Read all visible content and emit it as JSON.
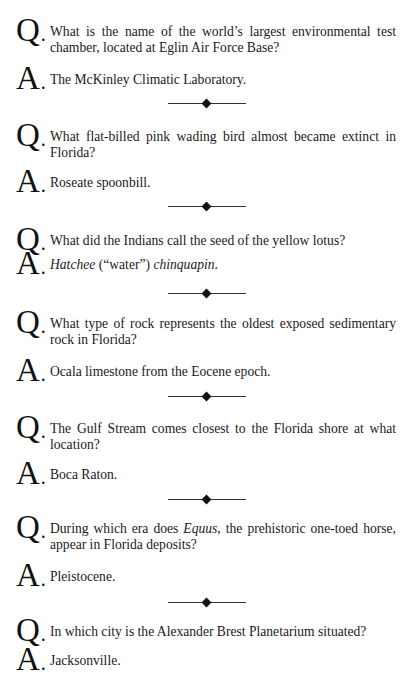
{
  "page": {
    "q_label": "Q",
    "a_label": "A",
    "items": [
      {
        "question": "What is the name of the world’s largest environmental test chamber, located at Eglin Air Force Base?",
        "answer_parts": [
          "The McKinley Climatic Laboratory."
        ]
      },
      {
        "question": "What flat-billed pink wading bird almost became extinct in Florida?",
        "answer_parts": [
          "Roseate spoonbill."
        ]
      },
      {
        "question": "What did the Indians call the seed of the yellow lotus?",
        "answer_parts": [
          "Hatchee",
          " (“water”) ",
          "chinquapin",
          "."
        ]
      },
      {
        "question": "What type of rock represents the oldest exposed sedimentary rock in Florida?",
        "answer_parts": [
          "Ocala limestone from the Eocene epoch."
        ]
      },
      {
        "question": "The Gulf Stream comes closest to the Florida shore at what location?",
        "answer_parts": [
          "Boca Raton."
        ]
      },
      {
        "question_parts": [
          "During which era does ",
          "Equus",
          ", the prehistoric one-toed horse, appear in Florida deposits?"
        ],
        "answer_parts": [
          "Pleistocene."
        ]
      },
      {
        "question": "In which city is the Alexander Brest Planetarium situated?",
        "answer_parts": [
          "Jacksonville."
        ]
      }
    ],
    "separator_icon": "diamond-rule-icon"
  }
}
